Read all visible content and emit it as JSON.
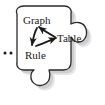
{
  "figure": {
    "type": "puzzle-piece-diagram",
    "shape_name": "jigsaw-puzzle-piece",
    "outline_color": "#2b2b2b",
    "fill_color": "#ffffff",
    "shadow_color": "#b3b3b3",
    "arrow_color": "#1a1a1a",
    "text_color": "#1a1a1a"
  },
  "nodes": [
    {
      "id": "graph",
      "label": "Graph"
    },
    {
      "id": "table",
      "label": "Table"
    },
    {
      "id": "rule",
      "label": "Rule"
    }
  ],
  "edges": [
    {
      "from": "graph",
      "to": "rule"
    },
    {
      "from": "rule",
      "to": "table"
    },
    {
      "from": "table",
      "to": "graph"
    }
  ],
  "ellipsis": {
    "label": "..",
    "dot_count": 2
  },
  "tabs": [
    {
      "name": "right-knob",
      "position": "right"
    },
    {
      "name": "bottom-knob",
      "position": "bottom"
    }
  ]
}
